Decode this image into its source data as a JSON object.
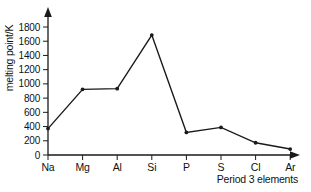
{
  "figure": {
    "background": "#ffffff",
    "line_color": "#1a1a1a",
    "text_color": "#111111"
  },
  "chart_data": {
    "type": "line",
    "title": "",
    "xlabel": "Period 3 elements",
    "ylabel": "melting point/K",
    "categories": [
      "Na",
      "Mg",
      "Al",
      "Si",
      "P",
      "S",
      "Cl",
      "Ar"
    ],
    "values": [
      371,
      923,
      933,
      1687,
      317,
      388,
      172,
      84
    ],
    "ylim": [
      0,
      1800
    ],
    "yticks": [
      0,
      200,
      400,
      600,
      800,
      1000,
      1200,
      1400,
      1600,
      1800
    ],
    "grid": false,
    "legend": "none",
    "marker": "dot",
    "axis_arrows": true,
    "line_color": "#1a1a1a"
  }
}
